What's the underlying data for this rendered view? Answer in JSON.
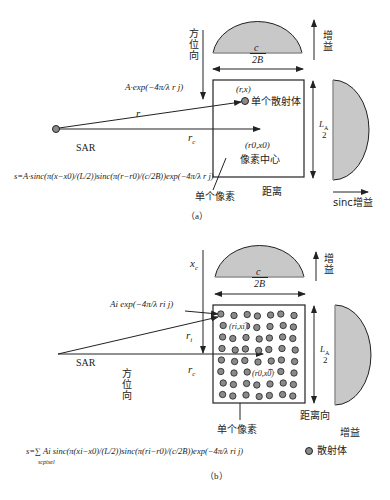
{
  "panel_a": {
    "caption": "（a）",
    "azimuth_label": "方位向",
    "gain_top_label": "增益",
    "range_width_num": "c",
    "range_width_den": "2B",
    "azimuth_height_num": "L",
    "azimuth_height_sub": "A",
    "azimuth_height_den": "2",
    "scatterer_coord": "(r,x)",
    "scatterer_label": "单个散射体",
    "signal_expr": "A·exp(−4π/λ r j)",
    "r_label": "r",
    "rc_label": "r",
    "rc_sub": "c",
    "sar_label": "SAR",
    "pixel_center_coord": "(r0,x0)",
    "pixel_center_label": "像素中心",
    "single_pixel_label": "单个像素",
    "range_label": "距离",
    "sinc_gain_label": "sinc增益",
    "formula": "s=A·sinc(π(x−x0)/(L/2))sinc(π(r−r0)/(c/2B))exp(−4π/λ r j)"
  },
  "panel_b": {
    "caption": "（b）",
    "xc_label": "x",
    "xc_sub": "c",
    "gain_top_label": "增益",
    "range_width_num": "c",
    "range_width_den": "2B",
    "azimuth_height_num": "L",
    "azimuth_height_sub": "A",
    "azimuth_height_den": "2",
    "signal_expr": "Ai exp(−4π/λ ri j)",
    "ri_label": "r",
    "ri_sub": "i",
    "rc_label": "r",
    "rc_sub": "c",
    "sar_label": "SAR",
    "azimuth_label": "方位向",
    "scatterer_i_coord": "(ri,xi)",
    "pixel_center_coord": "(r0,x0)",
    "single_pixel_label": "单个像素",
    "range_label": "距离向",
    "gain_label": "增益",
    "legend_scatterer": "散射体",
    "formula": "s=∑ Ai sinc(π(xi−x0)/(L/2))sinc(π(ri−r0)/(c/2B))exp(−4π/λ ri j)",
    "sum_sub": "scpixel"
  },
  "colors": {
    "gain_fill": "#c8c8c8",
    "scatterer_fill": "#8a8a8a",
    "line": "#222222"
  }
}
